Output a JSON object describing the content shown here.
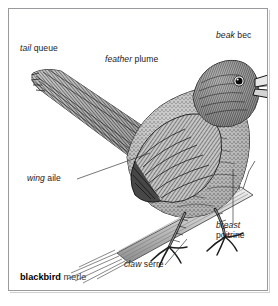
{
  "plate": {
    "type": "labelled-illustration",
    "subject": "blackbird perched on a branch",
    "style": "black-and-white engraving / stipple drawing",
    "background_color": "#ffffff",
    "frame_color": "#9a9a9e",
    "ink_color": "#2b2b2b"
  },
  "caption": {
    "term": "blackbird",
    "gloss": "merle"
  },
  "labels": [
    {
      "id": "tail",
      "en": "tail",
      "fr": "queue",
      "leader": false
    },
    {
      "id": "feather",
      "en": "feather",
      "fr": "plume",
      "leader": false
    },
    {
      "id": "beak",
      "en": "beak",
      "fr": "bec",
      "leader": false
    },
    {
      "id": "wing",
      "en": "wing",
      "fr": "aile",
      "leader": true
    },
    {
      "id": "breast",
      "en": "breast",
      "fr": "poitrine",
      "leader": true
    },
    {
      "id": "claw",
      "en": "claw",
      "fr": "serre",
      "leader": true
    }
  ]
}
